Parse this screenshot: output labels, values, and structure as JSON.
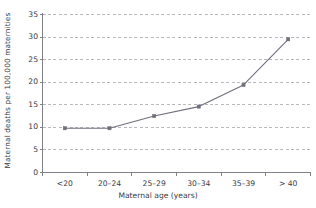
{
  "chart_data": {
    "type": "line",
    "title": "",
    "subtitle": "",
    "xlabel": "Maternal age (years)",
    "ylabel": "Maternal deaths per 100,000 maternities",
    "categories": [
      "<20",
      "20–24",
      "25–29",
      "30–34",
      "35–39",
      "> 40"
    ],
    "values": [
      9.8,
      9.8,
      12.5,
      14.6,
      19.4,
      29.5
    ],
    "series": [
      {
        "name": "Maternal deaths per 100,000 maternities",
        "values": [
          9.8,
          9.8,
          12.5,
          14.6,
          19.4,
          29.5
        ]
      }
    ],
    "ylim": [
      0,
      35
    ],
    "yticks": [
      0,
      5,
      10,
      15,
      20,
      25,
      30,
      35
    ],
    "ytick_labels": [
      "0",
      "5",
      "10",
      "15",
      "20",
      "25",
      "30",
      "35"
    ],
    "grid": true,
    "grid_axis": "y",
    "grid_style": "dashed",
    "legend": false,
    "legend_position": "none",
    "marker": "square",
    "line_color": "#6f6f7c",
    "marker_color": "#6f6f7c",
    "grid_color": "#9a9aa2",
    "axis_color": "#808089",
    "text_color": "#3a3a44",
    "background": "#ffffff"
  }
}
